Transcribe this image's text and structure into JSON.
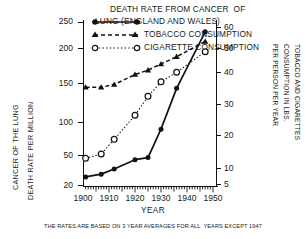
{
  "figure": {
    "caption": "THE RATES ARE BASED ON 3 YEAR AVERAGES FOR ALL  YEARS EXCEPT 1947",
    "title_line1": "DEATH RATE FROM CANCER  OF",
    "title_line2": "LUNG (ENGLAND AND WALES)"
  },
  "legend": {
    "items": [
      {
        "label_line1": "DEATH RATE FROM CANCER  OF",
        "label_line2": "LUNG (ENGLAND AND WALES)",
        "marker": "filled-circle-solid-line"
      },
      {
        "label": "TOBACCO CONSUMPTION",
        "marker": "filled-triangle-dashed-line"
      },
      {
        "label": "CIGARETTE CONSUMPTION",
        "marker": "open-circle-dotted-line"
      }
    ]
  },
  "axes": {
    "left_title_line1": "CANCER OF THE LUNG",
    "left_title_line2": "DEATH RATE PER MILLION",
    "right_title_line1": "TOBACCO AND CIGARETTES",
    "right_title_line2": "CONSUMPTION IN LBS.",
    "right_title_line3": "PER PERSON PER YEAR",
    "x_title": "YEAR",
    "left_ticks": [
      "20",
      "50",
      "100",
      "150",
      "200",
      "250"
    ],
    "right_ticks": [
      "5",
      "10",
      "20",
      "30",
      "40",
      "50",
      "60"
    ],
    "x_ticks": [
      "1900",
      "1910",
      "1920",
      "1930",
      "1940",
      "1950"
    ]
  },
  "chart_data": {
    "type": "line",
    "title": "DEATH RATE FROM CANCER OF LUNG (ENGLAND AND WALES)",
    "xlabel": "YEAR",
    "ylabel": "CANCER OF THE LUNG DEATH RATE PER MILLION",
    "ylabel_right": "TOBACCO AND CIGARETTES CONSUMPTION IN LBS. PER PERSON PER YEAR",
    "xlim": [
      1900,
      1950
    ],
    "ylim": [
      20,
      250
    ],
    "yscale": "log",
    "ylim_right": [
      4,
      62
    ],
    "yscale_right": "log",
    "grid": false,
    "legend_position": "top-center",
    "annotation": "THE RATES ARE BASED ON 3 YEAR AVERAGES FOR ALL YEARS EXCEPT 1947",
    "series": [
      {
        "name": "DEATH RATE FROM CANCER OF LUNG (ENGLAND AND WALES)",
        "axis": "left",
        "unit": "deaths per million",
        "marker": "filled-circle",
        "line": "solid",
        "x": [
          1901,
          1907,
          1912,
          1920,
          1925,
          1930,
          1936,
          1947
        ],
        "values": [
          23,
          24,
          26,
          30,
          31,
          48,
          90,
          215
        ]
      },
      {
        "name": "TOBACCO CONSUMPTION",
        "axis": "right",
        "unit": "lbs per person per year",
        "marker": "filled-triangle",
        "line": "dashed",
        "x": [
          1901,
          1907,
          1912,
          1920,
          1925,
          1930,
          1936,
          1947
        ],
        "values": [
          22,
          22,
          23,
          27,
          29,
          32,
          36,
          46
        ]
      },
      {
        "name": "CIGARETTE CONSUMPTION",
        "axis": "right",
        "unit": "lbs per person per year",
        "marker": "open-circle",
        "line": "dotted",
        "x": [
          1901,
          1907,
          1912,
          1920,
          1925,
          1930,
          1936,
          1947
        ],
        "values": [
          7,
          7.5,
          9.5,
          14,
          19,
          24,
          28,
          39
        ]
      }
    ]
  }
}
